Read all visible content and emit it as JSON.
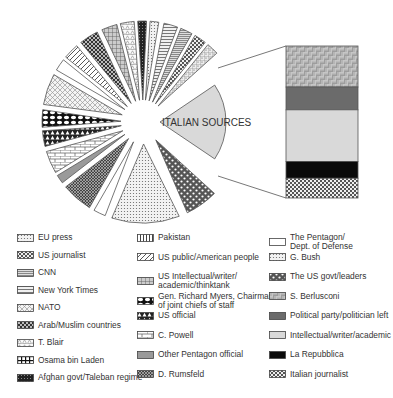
{
  "chart_data": {
    "type": "pie",
    "title": "",
    "annotation": "ITALIAN SOURCES",
    "center_label": "ITALIAN SOURCES",
    "pie_slices": [
      {
        "label": "ITALIAN SOURCES",
        "start": -34,
        "end": 34,
        "pattern": "lightgray",
        "share_pct": 19
      },
      {
        "label": "The US govt/leaders",
        "start": 45,
        "end": 64,
        "pattern": "dots-dark",
        "share_pct": 5
      },
      {
        "label": "G. Bush",
        "start": 69,
        "end": 108,
        "pattern": "fine-dots",
        "share_pct": 11
      },
      {
        "label": "The Pentagon/ Dept. of Defense",
        "start": 112,
        "end": 119,
        "pattern": "white",
        "share_pct": 2
      },
      {
        "label": "D. Rumsfeld",
        "start": 122,
        "end": 140,
        "pattern": "dense-check",
        "share_pct": 5
      },
      {
        "label": "Other Pentagon official",
        "start": 143,
        "end": 148,
        "pattern": "gray",
        "share_pct": 1.5
      },
      {
        "label": "C. Powell",
        "start": 150,
        "end": 163,
        "pattern": "brick",
        "share_pct": 3.5
      },
      {
        "label": "US official",
        "start": 166,
        "end": 175,
        "pattern": "triangles",
        "share_pct": 2.5
      },
      {
        "label": "Gen. Richard Myers, Chairman of joint chiefs of staff",
        "start": 177,
        "end": 187,
        "pattern": "ovals",
        "share_pct": 3
      },
      {
        "label": "NATO",
        "start": 190,
        "end": 208,
        "pattern": "crosshatch-light",
        "share_pct": 5
      },
      {
        "label": "T. Blair",
        "start": 211,
        "end": 218,
        "pattern": "boxes",
        "share_pct": 2
      },
      {
        "label": "US public/American people",
        "start": 220,
        "end": 229,
        "pattern": "diag",
        "share_pct": 2.5
      },
      {
        "label": "Arab/Muslim countries",
        "start": 232,
        "end": 243,
        "pattern": "dark-check",
        "share_pct": 3
      },
      {
        "label": "CNN",
        "start": 246,
        "end": 255,
        "pattern": "grid",
        "share_pct": 2.5
      },
      {
        "label": "NATO (2)",
        "start": 257,
        "end": 265,
        "pattern": "tri-light",
        "share_pct": 2.2
      },
      {
        "label": "Arab/Muslim countries (2)",
        "start": 267,
        "end": 272,
        "pattern": "dark-fine",
        "share_pct": 1.5
      },
      {
        "label": "EU press",
        "start": 274,
        "end": 279,
        "pattern": "fine-dots",
        "share_pct": 1.5
      },
      {
        "label": "New York Times",
        "start": 282,
        "end": 290,
        "pattern": "hlines",
        "share_pct": 2.2
      },
      {
        "label": "CNN (2)",
        "start": 292,
        "end": 299,
        "pattern": "hlines-dense",
        "share_pct": 2
      },
      {
        "label": "US journalist",
        "start": 301,
        "end": 308,
        "pattern": "checker",
        "share_pct": 2
      },
      {
        "label": "Pakistan",
        "start": 310,
        "end": 317,
        "pattern": "grid-dots",
        "share_pct": 2
      }
    ],
    "italian_breakdown": [
      {
        "label": "S. Berlusconi",
        "share_pct": 27,
        "pattern": "basketweave"
      },
      {
        "label": "Political party/politician left",
        "share_pct": 15,
        "pattern": "darkgray"
      },
      {
        "label": "Intellectual/writer/academic",
        "share_pct": 34,
        "pattern": "lightgray"
      },
      {
        "label": "La Repubblica",
        "share_pct": 11,
        "pattern": "black"
      },
      {
        "label": "Italian journalist",
        "share_pct": 13,
        "pattern": "checker"
      }
    ],
    "legend": [
      "EU press",
      "US journalist",
      "CNN",
      "New York Times",
      "NATO",
      "Arab/Muslim countries",
      "T. Blair",
      "Osama bin Laden",
      "Afghan govt/Taleban regime",
      "Pakistan",
      "US public/American people",
      "US Intellectual/writer/ academic/thinktank",
      "Gen. Richard Myers, Chairman of joint chiefs of staff",
      "US official",
      "C. Powell",
      "Other Pentagon official",
      "D. Rumsfeld",
      "The Pentagon/ Dept. of Defense",
      "G. Bush",
      "The US govt/leaders",
      "S. Berlusconi",
      "Political party/politician left",
      "Intellectual/writer/academic",
      "La Repubblica",
      "Italian journalist"
    ]
  },
  "legend": {
    "col1": [
      {
        "label": "EU press",
        "pattern": "fine-dots"
      },
      {
        "label": "US journalist",
        "pattern": "checker"
      },
      {
        "label": "CNN",
        "pattern": "hlines-dense"
      },
      {
        "label": "New York Times",
        "pattern": "hlines"
      },
      {
        "label": "NATO",
        "pattern": "crosshatch-light"
      },
      {
        "label": "Arab/Muslim countries",
        "pattern": "dark-check"
      },
      {
        "label": "T. Blair",
        "pattern": "tri-light"
      },
      {
        "label": "Osama bin Laden",
        "pattern": "bricks-dark"
      },
      {
        "label": "Afghan govt/Taleban regime",
        "pattern": "dark-fine"
      }
    ],
    "col2": [
      {
        "label": "Pakistan",
        "pattern": "vlines"
      },
      {
        "label": "US public/American people",
        "pattern": "diag"
      },
      {
        "label": "US Intellectual/writer/\nacademic/thinktank",
        "pattern": "grid"
      },
      {
        "label": "Gen. Richard Myers, Chairman\nof joint chiefs of staff",
        "pattern": "ovals"
      },
      {
        "label": "US official",
        "pattern": "triangles"
      },
      {
        "label": "C. Powell",
        "pattern": "brick"
      },
      {
        "label": "Other Pentagon official",
        "pattern": "gray"
      },
      {
        "label": "D. Rumsfeld",
        "pattern": "dense-check"
      }
    ],
    "col3": [
      {
        "label": "The Pentagon/\nDept. of Defense",
        "pattern": "white"
      },
      {
        "label": "G. Bush",
        "pattern": "fine-dots"
      },
      {
        "label": "The US govt/leaders",
        "pattern": "dots-dark"
      },
      {
        "label": "S. Berlusconi",
        "pattern": "basketweave"
      },
      {
        "label": "Political party/politician left",
        "pattern": "darkgray"
      },
      {
        "label": "Intellectual/writer/academic",
        "pattern": "lightgray"
      },
      {
        "label": "La Repubblica",
        "pattern": "black"
      },
      {
        "label": "Italian journalist",
        "pattern": "checker"
      }
    ]
  },
  "colors": {
    "stroke": "#555555",
    "lightgray": "#d9d9d9",
    "darkgray": "#6b6b6b",
    "gray": "#9a9a9a",
    "black": "#0a0a0a"
  }
}
